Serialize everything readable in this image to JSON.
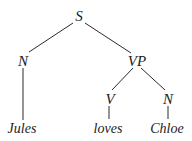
{
  "diagram": {
    "type": "syntax-tree",
    "nodes": {
      "S": {
        "label": "S"
      },
      "N1": {
        "label": "N"
      },
      "VP": {
        "label": "VP"
      },
      "V": {
        "label": "V"
      },
      "N2": {
        "label": "N"
      },
      "jules": {
        "label": "Jules"
      },
      "loves": {
        "label": "loves"
      },
      "chloe": {
        "label": "Chloe"
      }
    },
    "edges": [
      [
        "S",
        "N1"
      ],
      [
        "S",
        "VP"
      ],
      [
        "N1",
        "jules"
      ],
      [
        "VP",
        "V"
      ],
      [
        "VP",
        "N2"
      ],
      [
        "V",
        "loves"
      ],
      [
        "N2",
        "chloe"
      ]
    ],
    "colors": {
      "ink": "#1a1a1a",
      "background": "#ffffff"
    }
  }
}
